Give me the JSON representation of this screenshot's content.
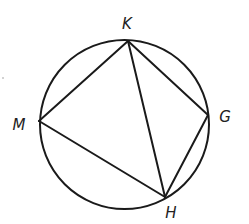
{
  "diagram": {
    "type": "inscribed-quadrilateral",
    "circle": {
      "cx": 124.5,
      "cy": 124.5,
      "r": 84.5
    },
    "points": [
      {
        "id": "K",
        "label": "K",
        "x": 128,
        "y": 41,
        "lx": 127,
        "ly": 29
      },
      {
        "id": "G",
        "label": "G",
        "x": 208,
        "y": 115,
        "lx": 225,
        "ly": 122
      },
      {
        "id": "H",
        "label": "H",
        "x": 165,
        "y": 197,
        "lx": 171,
        "ly": 218
      },
      {
        "id": "M",
        "label": "M",
        "x": 39,
        "y": 121,
        "lx": 19,
        "ly": 130
      }
    ],
    "segments": [
      [
        "K",
        "M"
      ],
      [
        "M",
        "H"
      ],
      [
        "H",
        "G"
      ],
      [
        "G",
        "K"
      ],
      [
        "K",
        "H"
      ]
    ],
    "stroke_color": "#1a1a1a"
  }
}
